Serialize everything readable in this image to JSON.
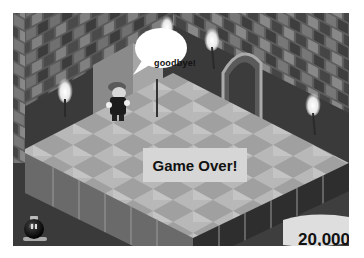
{
  "scene": {
    "speech_bubble": "goodbye!",
    "banner": "Game Over!",
    "score": "20,000",
    "lives_icon": "bob-omb-icon",
    "character": "mario-sprite",
    "torches": 4
  },
  "colors": {
    "wall_dark": "#3a3a3a",
    "wall_mid": "#6e6e6e",
    "floor_light": "#b4b4b4",
    "floor_dark": "#8e8e8e",
    "banner_bg": "#d6d6d6",
    "text": "#111111"
  }
}
